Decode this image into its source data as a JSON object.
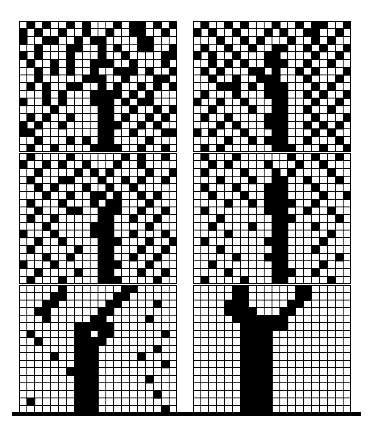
{
  "figure": {
    "title": "",
    "caption": "",
    "type": "binary-lattice-grid-array",
    "background_color": "#ffffff",
    "ink_color": "#000000",
    "grid_line_color": "#000000",
    "panel_count": 6,
    "panel_columns": 2,
    "panel_rows": 3,
    "grid_cols": 20,
    "grid_rows": 17,
    "cell_px": 7.8,
    "grid_line_px": 1
  },
  "ground_line": {
    "name": "ground-line",
    "x": 12,
    "y": 412,
    "width": 349,
    "height": 4,
    "color": "#000000"
  },
  "panels": [
    {
      "id": "panel-top-left",
      "label": "top-left",
      "noise_level": "high",
      "x": 19,
      "y": 21,
      "w": 158,
      "h": 131,
      "cells": [
        "01010010100010110101",
        "10100100100100110010",
        "10011001011000011000",
        "00100011001010011001",
        "10100010001001000011",
        "01001010011100100010",
        "00101010010011101001",
        "00100000111001000110",
        "01010011001010010101",
        "00010100011110101000",
        "10010100011101011000",
        "00001000001100100101",
        "01010010001101001010",
        "10100100001110010100",
        "11000000001100100011",
        "00100010101100001000",
        "01001000011110010010"
      ]
    },
    {
      "id": "panel-top-right",
      "label": "top-right",
      "noise_level": "high",
      "x": 193,
      "y": 21,
      "w": 158,
      "h": 131,
      "cells": [
        "01001010001001011001",
        "10100100010100110010",
        "00010010100010010100",
        "01001001001100101001",
        "10100100011000010010",
        "00101010011100100100",
        "01010001101001010001",
        "00100100111000100010",
        "00011101011100010100",
        "01000100011100101001",
        "10010010001100010010",
        "00100001001100100100",
        "01001000011100010001",
        "00010100011100101010",
        "10100010001100010100",
        "00001001011100100010",
        "01010000001110001001"
      ]
    },
    {
      "id": "panel-middle-left",
      "label": "middle-left",
      "noise_level": "medium",
      "x": 19,
      "y": 153,
      "w": 158,
      "h": 131,
      "cells": [
        "01000010000001010010",
        "10010100100010010000",
        "00100001010100001001",
        "01000110001001010010",
        "00101000100100100000",
        "00010010011010010100",
        "01000100010110001000",
        "00100011001110010010",
        "01001000001100100100",
        "00010000011100001000",
        "10001000011100100010",
        "00100100001110001001",
        "01000001001100010010",
        "00010010001100100100",
        "10001000001110001000",
        "00100001001100010010",
        "01000100001110000100"
      ]
    },
    {
      "id": "panel-middle-right",
      "label": "middle-right",
      "noise_level": "medium-low",
      "x": 193,
      "y": 153,
      "w": 158,
      "h": 131,
      "cells": [
        "01000100000010010010",
        "00101000010001001000",
        "01000010001010000100",
        "00010001001100100010",
        "01000100011100010000",
        "00100010011100001001",
        "00001001011110010000",
        "01000000011100100100",
        "00010000001110000010",
        "00100001001100010000",
        "00001000001100000100",
        "01000000011100001000",
        "00010000001100010000",
        "00000100011100000010",
        "00100000001100001000",
        "00001000001110010000",
        "01000010001100000100"
      ]
    },
    {
      "id": "panel-bottom-left",
      "label": "bottom-left",
      "noise_level": "low",
      "x": 19,
      "y": 285,
      "w": 158,
      "h": 128,
      "cells": [
        "00000100000001100000",
        "00001100000011000000",
        "00011000000110000100",
        "00110000001100000000",
        "00010000011000001000",
        "00000001111100000000",
        "01000001101100000010",
        "00100001111000000000",
        "00000001110000000100",
        "00001001110000010000",
        "00000001110000000010",
        "00000011110000000000",
        "00000001110000001000",
        "00000001110000000000",
        "00000001110000000100",
        "01000001110000000000",
        "00000001110000000010"
      ]
    },
    {
      "id": "panel-bottom-right",
      "label": "bottom-right",
      "noise_level": "none",
      "x": 193,
      "y": 285,
      "w": 158,
      "h": 128,
      "cells": [
        "00000110000001100000",
        "00000110000001100000",
        "00001110000011000000",
        "00001111000110000000",
        "00000111111100000000",
        "00000011111100000000",
        "00000011110000000000",
        "00000011110000000000",
        "00000011110000000000",
        "00000011110000000000",
        "00000011110000000000",
        "00000011110000000000",
        "00000011110000000000",
        "00000011110000000000",
        "00000011110000000000",
        "00000011110000000000",
        "00000011110000000000"
      ]
    }
  ],
  "chart_data": {
    "type": "heatmap",
    "title": "",
    "xlabel": "",
    "ylabel": "",
    "legend": [
      {
        "value": 1,
        "label": "occupied",
        "color": "#000000"
      },
      {
        "value": 0,
        "label": "empty",
        "color": "#ffffff"
      }
    ],
    "series": [
      {
        "name": "top-left",
        "noise_fraction": 0.35
      },
      {
        "name": "top-right",
        "noise_fraction": 0.3
      },
      {
        "name": "middle-left",
        "noise_fraction": 0.22
      },
      {
        "name": "middle-right",
        "noise_fraction": 0.15
      },
      {
        "name": "bottom-left",
        "noise_fraction": 0.06
      },
      {
        "name": "bottom-right",
        "noise_fraction": 0.0
      }
    ]
  }
}
